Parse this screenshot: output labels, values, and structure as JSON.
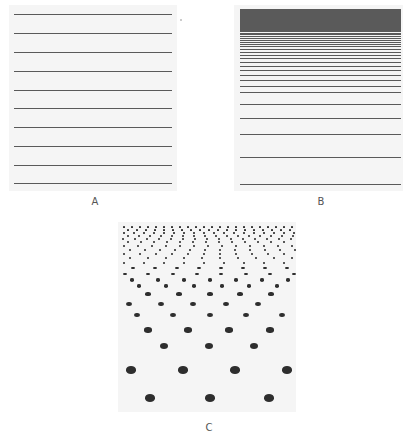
{
  "figure": {
    "panels": [
      {
        "id": "A",
        "label": "A",
        "description": "Evenly spaced horizontal lines",
        "box": {
          "x": 9,
          "y": 5,
          "w": 168,
          "h": 186
        },
        "line_color": "#5a5a5a",
        "line_inset": {
          "left": 5,
          "right": 5
        },
        "line_ys": [
          14,
          33,
          52,
          71,
          90,
          108,
          127,
          146,
          165,
          183
        ]
      },
      {
        "id": "B",
        "label": "B",
        "description": "Horizontal lines with spacing decreasing toward the top (texture gradient)",
        "box": {
          "x": 234,
          "y": 5,
          "w": 169,
          "h": 186
        },
        "line_color": "#5a5a5a",
        "line_inset": {
          "left": 6,
          "right": 2
        },
        "line_ys": [
          9,
          10,
          11,
          12,
          13,
          14,
          15,
          16,
          17,
          18,
          19,
          20,
          21,
          22,
          23,
          24,
          25,
          26,
          27,
          28,
          29,
          30,
          31,
          33,
          34,
          36,
          38,
          40,
          42,
          44,
          46,
          49,
          52,
          55,
          58,
          62,
          66,
          70,
          75,
          80,
          86,
          92,
          104,
          118,
          134,
          157,
          184
        ]
      },
      {
        "id": "C",
        "label": "C",
        "description": "Dot field in perspective, dots shrink and crowd toward the top",
        "box": {
          "x": 118,
          "y": 222,
          "w": 178,
          "h": 190
        },
        "dot_color": "#2e2e2e",
        "rows": [
          {
            "y": 398,
            "r": 4.5,
            "xs": [
              150,
              210,
              269
            ]
          },
          {
            "y": 370,
            "r": 4.2,
            "xs": [
              131,
              183,
              235,
              287
            ]
          },
          {
            "y": 346,
            "r": 3.6,
            "xs": [
              164,
              209,
              254
            ]
          },
          {
            "y": 330,
            "r": 3.2,
            "xs": [
              148,
              188,
              229,
              270
            ]
          },
          {
            "y": 315,
            "r": 2.8,
            "xs": [
              137,
              173,
              210,
              246,
              282
            ]
          },
          {
            "y": 304,
            "r": 2.5,
            "xs": [
              129,
              161,
              193,
              226,
              258
            ]
          },
          {
            "y": 294,
            "r": 2.2,
            "xs": [
              148,
              179,
              210,
              240,
              271
            ]
          },
          {
            "y": 286,
            "r": 2.0,
            "xs": [
              139,
              166,
              194,
              222,
              249,
              277,
              303
            ]
          },
          {
            "y": 280,
            "r": 1.8,
            "xs": [
              132,
              158,
              184,
              210,
              236,
              262,
              288
            ]
          },
          {
            "y": 274,
            "r": 1.6,
            "xs": [
              125,
              148,
              173,
              197,
              221,
              246,
              270,
              294
            ]
          },
          {
            "y": 268,
            "r": 1.4,
            "xs": [
              133,
              155,
              177,
              199,
              221,
              243,
              265,
              287
            ]
          },
          {
            "y": 263,
            "r": 1.3,
            "xs": [
              124,
              144,
              164,
              184,
              204,
              224,
              244,
              264,
              284
            ]
          },
          {
            "y": 258,
            "r": 1.2,
            "xs": [
              130,
              148,
              166,
              184,
              202,
              220,
              238,
              256,
              274,
              292
            ]
          },
          {
            "y": 254,
            "r": 1.1,
            "xs": [
              124,
              140,
              156,
              172,
              188,
              204,
              220,
              236,
              252,
              268,
              284
            ]
          },
          {
            "y": 250,
            "r": 1.0,
            "xs": [
              130,
              145,
              160,
              175,
              190,
              205,
              220,
              235,
              250,
              265,
              280,
              295
            ]
          },
          {
            "y": 246,
            "r": 0.95,
            "xs": [
              124,
              138,
              152,
              166,
              180,
              194,
              208,
              222,
              236,
              250,
              264,
              278,
              292
            ]
          },
          {
            "y": 242,
            "r": 0.9,
            "xs": [
              128,
              141,
              154,
              167,
              180,
              193,
              206,
              219,
              232,
              245,
              258,
              271,
              284
            ]
          },
          {
            "y": 239,
            "r": 0.85,
            "xs": [
              123,
              135,
              147,
              159,
              171,
              183,
              195,
              207,
              219,
              231,
              243,
              255,
              267,
              279,
              291
            ]
          },
          {
            "y": 236,
            "r": 0.8,
            "xs": [
              128,
              139,
              150,
              161,
              172,
              183,
              194,
              205,
              216,
              227,
              238,
              249,
              260,
              271,
              282,
              293
            ]
          },
          {
            "y": 233,
            "r": 0.75,
            "xs": [
              124,
              134,
              144,
              154,
              164,
              174,
              184,
              194,
              204,
              214,
              224,
              234,
              244,
              254,
              264,
              274,
              284,
              294
            ]
          },
          {
            "y": 230,
            "r": 0.7,
            "xs": [
              128,
              137,
              146,
              155,
              164,
              173,
              182,
              191,
              200,
              209,
              218,
              227,
              236,
              245,
              254,
              263,
              272,
              281,
              290
            ]
          },
          {
            "y": 227,
            "r": 0.65,
            "xs": [
              124,
              132,
              140,
              148,
              156,
              164,
              172,
              180,
              188,
              196,
              204,
              212,
              220,
              228,
              236,
              244,
              252,
              260,
              268,
              276,
              284,
              292
            ]
          }
        ]
      }
    ],
    "labels": [
      {
        "text": "A",
        "x": 95,
        "y": 196
      },
      {
        "text": "B",
        "x": 321,
        "y": 196
      },
      {
        "text": "C",
        "x": 209,
        "y": 422
      }
    ],
    "specks": [
      {
        "x": 180,
        "y": 19
      }
    ]
  }
}
